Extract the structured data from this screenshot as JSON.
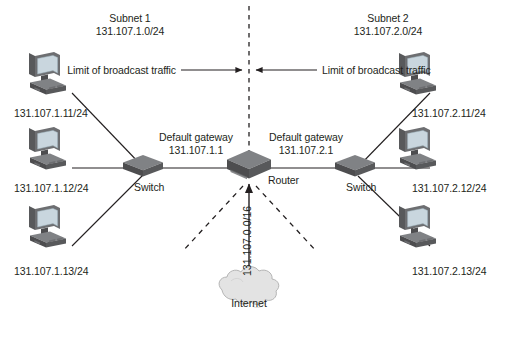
{
  "diagram": {
    "subnets": [
      {
        "name": "Subnet 1",
        "cidr": "131.107.1.0/24"
      },
      {
        "name": "Subnet 2",
        "cidr": "131.107.2.0/24"
      }
    ],
    "broadcast_labels": [
      {
        "text": "Limit of broadcast traffic",
        "arrow": "right"
      },
      {
        "text": "Limit of broadcast traffic",
        "arrow": "left"
      }
    ],
    "gateways": [
      {
        "label": "Default gateway",
        "address": "131.107.1.1"
      },
      {
        "label": "Default gateway",
        "address": "131.107.2.1"
      }
    ],
    "devices": {
      "router_label": "Router",
      "switch_left_label": "Switch",
      "switch_right_label": "Switch",
      "internet_label": "Internet",
      "wan_address": "131.107.0.0/16"
    },
    "hosts_left": [
      {
        "address": "131.107.1.11/24"
      },
      {
        "address": "131.107.1.12/24"
      },
      {
        "address": "131.107.1.13/24"
      }
    ],
    "hosts_right": [
      {
        "address": "131.107.2.11/24"
      },
      {
        "address": "131.107.2.12/24"
      },
      {
        "address": "131.107.2.13/24"
      }
    ],
    "colors": {
      "line": "#231f20",
      "device_dark": "#4d4d4f",
      "device_mid": "#6d6e71",
      "device_light": "#8c8d8f",
      "screen": "#c9d6de",
      "cloud": "#e3e3e3",
      "cloud_edge": "#b5b5b5",
      "background": "#ffffff"
    }
  }
}
